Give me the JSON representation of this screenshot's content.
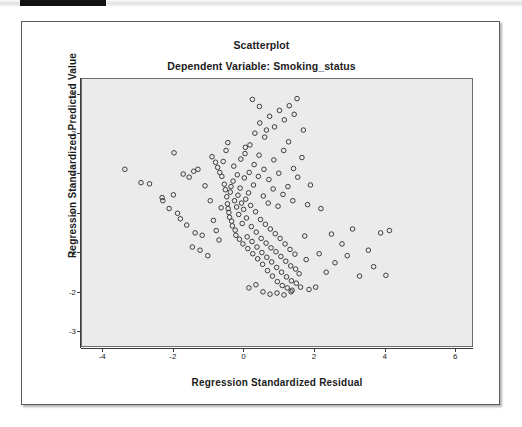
{
  "window": {
    "top_accent_color": "#111111",
    "top_strip_color": "#e2e2e2"
  },
  "chart_data": {
    "type": "scatter",
    "title": "Scatterplot",
    "subtitle": "Dependent Variable: Smoking_status",
    "xlabel": "Regression Standardized Residual",
    "ylabel": "Regression Standardized Predicted Value",
    "xlim": [
      -4.6,
      6.5
    ],
    "ylim": [
      -3.4,
      3.4
    ],
    "xticks": [
      -4,
      -2,
      0,
      2,
      4,
      6
    ],
    "xtick_labels": [
      "-4",
      "-2",
      "0",
      "2",
      "4",
      "6"
    ],
    "yticks": [
      3,
      2,
      1,
      0,
      -1,
      -2,
      -3
    ],
    "ytick_labels": [
      "3",
      "2",
      "1",
      "0",
      "-1",
      "-2",
      "-3"
    ],
    "grid": false,
    "legend": false,
    "marker": "open-circle",
    "marker_color": "#3b3b3b",
    "marker_size": 4.6,
    "plot_background": "#ebebeb",
    "points": [
      [
        -3.38,
        1.1
      ],
      [
        -2.92,
        0.76
      ],
      [
        -2.68,
        0.73
      ],
      [
        -2.32,
        0.38
      ],
      [
        -2.3,
        0.3
      ],
      [
        -2.12,
        0.1
      ],
      [
        -2.0,
        0.45
      ],
      [
        -1.88,
        -0.02
      ],
      [
        -1.8,
        -0.16
      ],
      [
        -1.62,
        -0.32
      ],
      [
        -1.38,
        -0.52
      ],
      [
        -1.18,
        -0.58
      ],
      [
        -1.55,
        0.9
      ],
      [
        -1.42,
        1.05
      ],
      [
        -0.9,
        1.42
      ],
      [
        -0.8,
        1.28
      ],
      [
        -0.74,
        1.15
      ],
      [
        -0.68,
        1.02
      ],
      [
        -0.62,
        0.92
      ],
      [
        -0.58,
        1.3
      ],
      [
        -0.55,
        0.72
      ],
      [
        -0.52,
        0.58
      ],
      [
        -0.5,
        1.58
      ],
      [
        -0.48,
        0.4
      ],
      [
        -0.46,
        0.22
      ],
      [
        -0.44,
        0.1
      ],
      [
        -0.42,
        0.0
      ],
      [
        -0.4,
        -0.12
      ],
      [
        -0.38,
        0.52
      ],
      [
        -0.36,
        0.66
      ],
      [
        -0.34,
        -0.22
      ],
      [
        -0.32,
        -0.34
      ],
      [
        -0.3,
        0.8
      ],
      [
        -0.28,
        1.18
      ],
      [
        -0.26,
        0.3
      ],
      [
        -0.24,
        -0.45
      ],
      [
        -0.22,
        -0.58
      ],
      [
        -0.2,
        0.14
      ],
      [
        -0.18,
        0.96
      ],
      [
        -0.16,
        0.44
      ],
      [
        -0.14,
        -0.05
      ],
      [
        -0.12,
        -0.68
      ],
      [
        -0.1,
        0.62
      ],
      [
        -0.08,
        1.36
      ],
      [
        -0.06,
        0.24
      ],
      [
        -0.04,
        -0.28
      ],
      [
        -0.02,
        -0.8
      ],
      [
        0.0,
        0.08
      ],
      [
        0.02,
        0.88
      ],
      [
        0.04,
        1.5
      ],
      [
        0.06,
        0.34
      ],
      [
        0.08,
        -0.14
      ],
      [
        0.1,
        -0.62
      ],
      [
        0.12,
        -0.92
      ],
      [
        0.14,
        0.5
      ],
      [
        0.16,
        1.02
      ],
      [
        0.18,
        1.72
      ],
      [
        0.2,
        0.18
      ],
      [
        0.22,
        -0.36
      ],
      [
        0.24,
        -0.74
      ],
      [
        0.26,
        -1.05
      ],
      [
        0.28,
        0.7
      ],
      [
        0.3,
        1.22
      ],
      [
        0.32,
        2.02
      ],
      [
        0.34,
        0.02
      ],
      [
        0.36,
        -0.5
      ],
      [
        0.38,
        -0.88
      ],
      [
        0.4,
        -1.18
      ],
      [
        0.42,
        0.92
      ],
      [
        0.44,
        1.46
      ],
      [
        0.46,
        2.28
      ],
      [
        0.48,
        -0.18
      ],
      [
        0.5,
        -0.66
      ],
      [
        0.52,
        -1.02
      ],
      [
        0.54,
        -1.32
      ],
      [
        0.56,
        0.42
      ],
      [
        0.58,
        1.1
      ],
      [
        0.6,
        1.92
      ],
      [
        0.62,
        -0.3
      ],
      [
        0.64,
        -0.78
      ],
      [
        0.66,
        -1.14
      ],
      [
        0.68,
        -1.48
      ],
      [
        0.7,
        0.24
      ],
      [
        0.72,
        0.84
      ],
      [
        0.74,
        2.45
      ],
      [
        0.76,
        -0.42
      ],
      [
        0.78,
        -0.9
      ],
      [
        0.8,
        -1.26
      ],
      [
        0.82,
        -1.62
      ],
      [
        0.84,
        0.6
      ],
      [
        0.86,
        1.34
      ],
      [
        0.88,
        2.18
      ],
      [
        0.9,
        -0.54
      ],
      [
        0.92,
        -1.0
      ],
      [
        0.94,
        -1.4
      ],
      [
        0.96,
        -1.76
      ],
      [
        0.98,
        0.16
      ],
      [
        1.0,
        1.0
      ],
      [
        1.02,
        2.6
      ],
      [
        1.04,
        -0.66
      ],
      [
        1.06,
        -1.12
      ],
      [
        1.08,
        -1.52
      ],
      [
        1.1,
        -1.86
      ],
      [
        1.12,
        0.46
      ],
      [
        1.14,
        1.58
      ],
      [
        1.16,
        2.36
      ],
      [
        1.18,
        -0.8
      ],
      [
        1.2,
        -1.24
      ],
      [
        1.22,
        -1.64
      ],
      [
        1.24,
        -1.92
      ],
      [
        1.26,
        0.66
      ],
      [
        1.28,
        1.8
      ],
      [
        1.3,
        2.72
      ],
      [
        1.32,
        -0.94
      ],
      [
        1.34,
        -1.36
      ],
      [
        1.36,
        -1.74
      ],
      [
        1.38,
        -1.98
      ],
      [
        1.4,
        0.3
      ],
      [
        1.42,
        1.12
      ],
      [
        1.44,
        2.5
      ],
      [
        1.46,
        -1.06
      ],
      [
        1.48,
        -1.44
      ],
      [
        1.5,
        -1.8
      ],
      [
        1.52,
        2.9
      ],
      [
        1.54,
        0.9
      ],
      [
        1.58,
        -1.56
      ],
      [
        1.62,
        -1.9
      ],
      [
        1.66,
        1.4
      ],
      [
        1.7,
        2.1
      ],
      [
        1.74,
        -0.6
      ],
      [
        1.78,
        -1.2
      ],
      [
        1.82,
        0.2
      ],
      [
        1.86,
        -1.96
      ],
      [
        1.9,
        0.7
      ],
      [
        2.05,
        -1.9
      ],
      [
        2.15,
        -1.05
      ],
      [
        2.2,
        0.1
      ],
      [
        2.35,
        -1.52
      ],
      [
        2.5,
        -0.55
      ],
      [
        2.6,
        -1.28
      ],
      [
        2.8,
        -0.8
      ],
      [
        2.95,
        -1.1
      ],
      [
        3.1,
        -0.42
      ],
      [
        3.3,
        -1.62
      ],
      [
        3.55,
        -0.96
      ],
      [
        3.7,
        -1.38
      ],
      [
        3.9,
        -0.52
      ],
      [
        4.05,
        -1.6
      ],
      [
        4.15,
        -0.46
      ],
      [
        -1.98,
        1.52
      ],
      [
        -1.72,
        0.98
      ],
      [
        -1.3,
        1.1
      ],
      [
        -1.1,
        0.68
      ],
      [
        -0.95,
        0.3
      ],
      [
        -0.86,
        -0.2
      ],
      [
        -0.78,
        -0.46
      ],
      [
        -0.7,
        -0.7
      ],
      [
        -0.64,
        0.12
      ],
      [
        -1.46,
        -0.88
      ],
      [
        -1.24,
        -0.96
      ],
      [
        -1.02,
        -1.1
      ],
      [
        0.15,
        -1.92
      ],
      [
        0.35,
        -1.84
      ],
      [
        0.55,
        -2.02
      ],
      [
        0.75,
        -2.08
      ],
      [
        0.95,
        -2.05
      ],
      [
        1.15,
        -2.1
      ],
      [
        1.35,
        -2.02
      ],
      [
        0.25,
        2.88
      ],
      [
        0.45,
        2.7
      ],
      [
        0.65,
        2.1
      ],
      [
        0.05,
        1.66
      ],
      [
        -0.45,
        1.78
      ]
    ]
  }
}
